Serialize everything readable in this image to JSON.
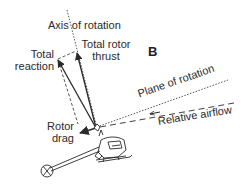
{
  "diagram": {
    "panel_label": "B",
    "labels": {
      "axis_of_rotation": "Axis of rotation",
      "total_rotor_thrust_line1": "Total rotor",
      "total_rotor_thrust_line2": "thrust",
      "total_reaction_line1": "Total",
      "total_reaction_line2": "reaction",
      "rotor_drag_line1": "Rotor",
      "rotor_drag_line2": "drag",
      "plane_of_rotation": "Plane of rotation",
      "relative_airflow": "Relative airflow"
    },
    "colors": {
      "line": "#2a2a2a",
      "background": "#ffffff"
    }
  }
}
